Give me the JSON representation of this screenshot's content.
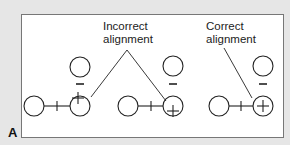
{
  "panel_label": "A",
  "labels": {
    "incorrect_line1": "Incorrect",
    "incorrect_line2": "alignment",
    "correct_line1": "Correct",
    "correct_line2": "alignment"
  },
  "symbols": {
    "bond": "+",
    "negative": "−",
    "positive": "+"
  },
  "groups": [
    {
      "name": "incorrect-1",
      "description": "plus offset up-left"
    },
    {
      "name": "incorrect-2",
      "description": "plus offset down"
    },
    {
      "name": "correct",
      "description": "plus centered"
    }
  ],
  "colors": {
    "background": "#e6e6e6",
    "panel": "#ffffff",
    "stroke": "#222222",
    "border": "#777777"
  }
}
